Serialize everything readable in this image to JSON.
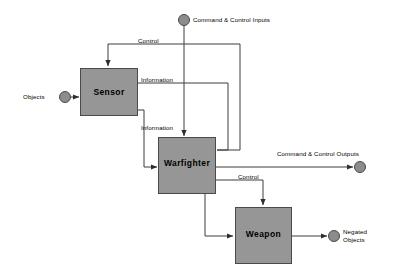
{
  "diagram": {
    "background_color": "#ffffff",
    "node_fill_color": "#969696",
    "node_border_color": "#4a4a4a",
    "terminal_fill_color": "#8c8c8c",
    "line_color": "#3c3c3c",
    "nodes": [
      {
        "id": "sensor",
        "label": "Sensor",
        "x": 80,
        "y": 68,
        "w": 58,
        "h": 48
      },
      {
        "id": "warfighter",
        "label": "Warfighter",
        "x": 158,
        "y": 137,
        "w": 58,
        "h": 57
      },
      {
        "id": "weapon",
        "label": "Weapon",
        "x": 235,
        "y": 207,
        "w": 57,
        "h": 57
      }
    ],
    "terminals": [
      {
        "id": "objects",
        "label": "Objects",
        "cx": 65,
        "cy": 97,
        "r": 5.5,
        "label_side": "left"
      },
      {
        "id": "cc-inputs",
        "label": "Command & Control Inputs",
        "cx": 184,
        "cy": 20,
        "r": 5.5,
        "label_side": "right"
      },
      {
        "id": "cc-outputs",
        "label": "Command & Control Outputs",
        "cx": 360,
        "cy": 167,
        "r": 5.5,
        "label_side": "above"
      },
      {
        "id": "negated-objects",
        "label_line1": "Negated",
        "label_line2": "Objects",
        "cx": 334,
        "cy": 236,
        "r": 5.5,
        "label_side": "right"
      }
    ],
    "edge_labels": [
      {
        "id": "control-to-sensor",
        "text": "Control",
        "x": 138,
        "y": 37
      },
      {
        "id": "information-sensor-up",
        "text": "Information",
        "x": 141,
        "y": 76
      },
      {
        "id": "information-sensor-down",
        "text": "Information",
        "x": 141,
        "y": 124
      },
      {
        "id": "control-to-weapon",
        "text": "Control",
        "x": 238,
        "y": 173
      }
    ],
    "flows": [
      {
        "from": "objects",
        "to": "sensor",
        "label": ""
      },
      {
        "from": "cc-inputs",
        "to": "warfighter",
        "label": ""
      },
      {
        "from": "warfighter",
        "to": "sensor",
        "label": "Control"
      },
      {
        "from": "sensor",
        "to": "warfighter",
        "label": "Information"
      },
      {
        "from": "sensor",
        "to": "warfighter",
        "label": "Information"
      },
      {
        "from": "warfighter",
        "to": "cc-outputs",
        "label": "Command & Control Outputs"
      },
      {
        "from": "warfighter",
        "to": "weapon",
        "label": "Control"
      },
      {
        "from": "warfighter",
        "to": "weapon",
        "label": ""
      },
      {
        "from": "weapon",
        "to": "negated-objects",
        "label": ""
      }
    ]
  }
}
